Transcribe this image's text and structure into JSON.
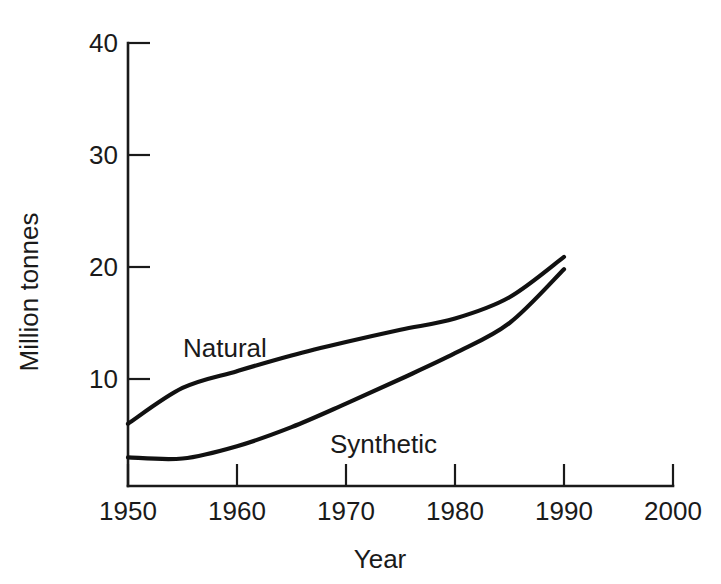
{
  "chart_data": {
    "type": "line",
    "title": "",
    "subtitle": "",
    "xlabel": "Year",
    "ylabel": "Million tonnes",
    "xlim": [
      1945,
      2000
    ],
    "ylim": [
      0,
      40
    ],
    "xticks": [
      1950,
      1960,
      1970,
      1980,
      1990,
      2000
    ],
    "xtick_labels": [
      "1950",
      "1960",
      "1970",
      "1980",
      "1990",
      "2000"
    ],
    "yticks": [
      10,
      20,
      30,
      40
    ],
    "ytick_labels": [
      "10",
      "20",
      "30",
      "40"
    ],
    "grid": false,
    "legend_position": "inline-annotation",
    "x": [
      1950,
      1955,
      1960,
      1965,
      1970,
      1975,
      1980,
      1985,
      1990
    ],
    "series": [
      {
        "name": "Natural",
        "label": "Natural",
        "color": "#111111",
        "values": [
          6.0,
          9.2,
          10.7,
          12.1,
          13.3,
          14.4,
          15.4,
          17.3,
          20.9
        ],
        "annotation": {
          "text": "Natural",
          "x": 1955.0,
          "y": 15.3
        }
      },
      {
        "name": "Synthetic",
        "label": "Synthetic",
        "color": "#111111",
        "values": [
          3.0,
          2.9,
          4.0,
          5.7,
          7.8,
          10.0,
          12.3,
          15.0,
          19.8
        ],
        "annotation": {
          "text": "Synthetic",
          "x": 1968.5,
          "y": 5.0
        }
      }
    ]
  },
  "axes": {
    "y_title": "Million tonnes",
    "x_title": "Year"
  }
}
